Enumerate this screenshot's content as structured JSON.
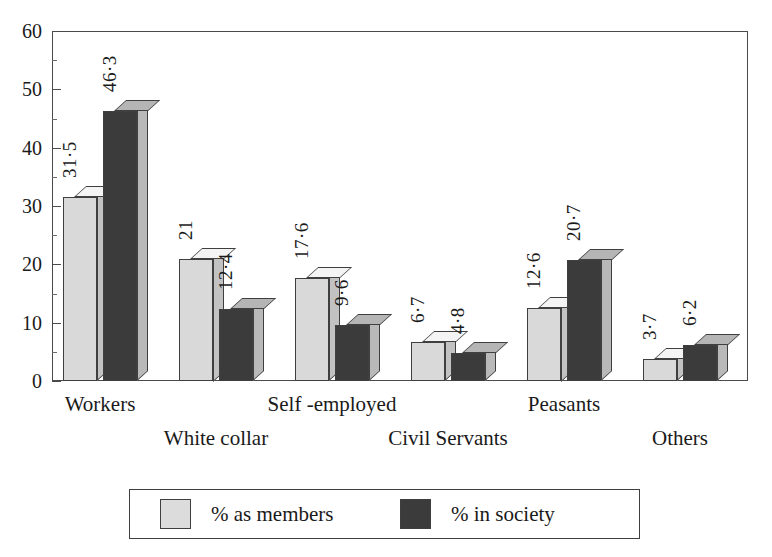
{
  "title_sliver": "INSURANCE",
  "chart_data": {
    "type": "bar",
    "title": "",
    "xlabel": "",
    "ylabel": "",
    "ylim": [
      0,
      60
    ],
    "ytick_labels": [
      "0",
      "10",
      "20",
      "30",
      "40",
      "50",
      "60"
    ],
    "ytick_values": [
      0,
      10,
      20,
      30,
      40,
      50,
      60
    ],
    "yminor_values": [
      5,
      15,
      25,
      35,
      45,
      55
    ],
    "grid": false,
    "legend_position": "bottom",
    "categories": [
      "Workers",
      "White collar",
      "Self -employed",
      "Civil Servants",
      "Peasants",
      "Others"
    ],
    "series": [
      {
        "name": "% as members",
        "color": "#d9d9d9",
        "values": [
          31.5,
          21,
          17.6,
          6.7,
          12.6,
          3.7
        ],
        "labels": [
          "31·5",
          "21",
          "17·6",
          "6·7",
          "12·6",
          "3·7"
        ]
      },
      {
        "name": "% in society",
        "color": "#3b3b3b",
        "values": [
          46.3,
          12.4,
          9.6,
          4.8,
          20.7,
          6.2
        ],
        "labels": [
          "46·3",
          "12·4",
          "9·6",
          "4·8",
          "20·7",
          "6·2"
        ]
      }
    ]
  },
  "legend": {
    "entries": [
      {
        "label": "% as members",
        "swatch": "light"
      },
      {
        "label": "% in society",
        "swatch": "dark"
      }
    ]
  }
}
